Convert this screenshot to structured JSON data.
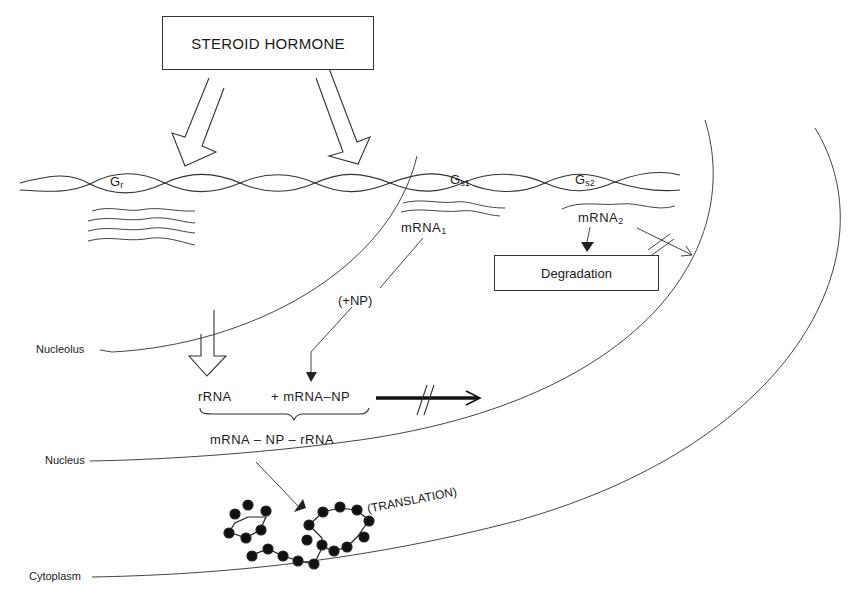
{
  "figure": {
    "hormone_box": "STEROID HORMONE",
    "genes": {
      "gr": {
        "base": "G",
        "sub": "r"
      },
      "gs1": {
        "base": "G",
        "sub": "s1"
      },
      "gs2": {
        "base": "G",
        "sub": "s2"
      }
    },
    "mrna1": {
      "base": "mRNA",
      "sub": "1"
    },
    "mrna2": {
      "base": "mRNA",
      "sub": "2"
    },
    "degradation_box": "Degradation",
    "np_label": "(+NP)",
    "rrna": "rRNA",
    "plus_mrna_np": "+ mRNA–NP",
    "complex": "mRNA – NP – rRNA",
    "translation": "(TRANSLATION)",
    "compartments": {
      "nucleolus": "Nucleolus",
      "nucleus": "Nucleus",
      "cytoplasm": "Cytoplasm"
    }
  }
}
